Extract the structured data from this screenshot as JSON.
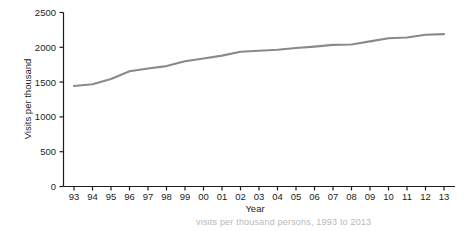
{
  "chart_data": {
    "type": "line",
    "title": "",
    "xlabel": "Year",
    "ylabel": "Visits per thousand",
    "x": [
      "93",
      "94",
      "95",
      "96",
      "97",
      "98",
      "99",
      "00",
      "01",
      "02",
      "03",
      "04",
      "05",
      "06",
      "07",
      "08",
      "09",
      "10",
      "11",
      "12",
      "13"
    ],
    "categories": [
      "93",
      "94",
      "95",
      "96",
      "97",
      "98",
      "99",
      "00",
      "01",
      "02",
      "03",
      "04",
      "05",
      "06",
      "07",
      "08",
      "09",
      "10",
      "11",
      "12",
      "13"
    ],
    "values": [
      1445,
      1470,
      1545,
      1655,
      1695,
      1730,
      1800,
      1840,
      1880,
      1935,
      1950,
      1965,
      1990,
      2010,
      2035,
      2040,
      2085,
      2130,
      2140,
      2180,
      2190
    ],
    "series": [
      {
        "name": "Visits per thousand",
        "color": "#8a8a8a",
        "values": [
          1445,
          1470,
          1545,
          1655,
          1695,
          1730,
          1800,
          1840,
          1880,
          1935,
          1950,
          1965,
          1990,
          2010,
          2035,
          2040,
          2085,
          2130,
          2140,
          2180,
          2190
        ]
      }
    ],
    "ylim": [
      0,
      2500
    ],
    "yticks": [
      0,
      500,
      1000,
      1500,
      2000,
      2500
    ],
    "ytick_labels": [
      "0",
      "500",
      "1000",
      "1500",
      "2000",
      "2500"
    ],
    "xtick_labels": [
      "93",
      "94",
      "95",
      "96",
      "97",
      "98",
      "99",
      "00",
      "01",
      "02",
      "03",
      "04",
      "05",
      "06",
      "07",
      "08",
      "09",
      "10",
      "11",
      "12",
      "13"
    ],
    "grid": false,
    "legend": null,
    "legend_position": "none",
    "line_color": "#8a8a8a",
    "axis_color": "#1c1c1c"
  },
  "axes": {
    "y_title": "Visits per thousand",
    "x_title": "Year"
  },
  "caption": {
    "partial_text": "visits per thousand persons, 1993 to 2013"
  }
}
